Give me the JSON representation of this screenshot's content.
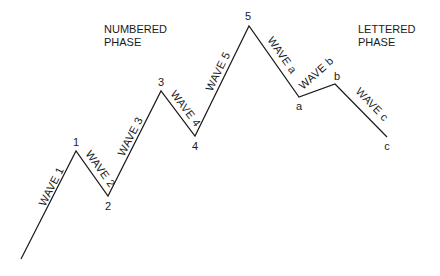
{
  "diagram": {
    "title_left": [
      "NUMBERED",
      "PHASE"
    ],
    "title_right": [
      "LETTERED",
      "PHASE"
    ],
    "colors": {
      "line": "#1a1a1a",
      "text": "#1a1a1a",
      "background": "#ffffff"
    },
    "vertices": [
      {
        "id": "start",
        "x": 21,
        "y": 259,
        "label": ""
      },
      {
        "id": "1",
        "x": 76,
        "y": 151,
        "label": "1"
      },
      {
        "id": "2",
        "x": 108,
        "y": 196,
        "label": "2"
      },
      {
        "id": "3",
        "x": 161,
        "y": 91,
        "label": "3"
      },
      {
        "id": "4",
        "x": 195,
        "y": 136,
        "label": "4"
      },
      {
        "id": "5",
        "x": 249,
        "y": 26,
        "label": "5"
      },
      {
        "id": "a",
        "x": 299,
        "y": 97,
        "label": "a"
      },
      {
        "id": "b",
        "x": 335,
        "y": 84,
        "label": "b"
      },
      {
        "id": "c",
        "x": 387,
        "y": 137,
        "label": "c"
      }
    ],
    "waves": [
      {
        "label": "WAVE 1",
        "from": "start",
        "to": "1"
      },
      {
        "label": "WAVE 2",
        "from": "1",
        "to": "2"
      },
      {
        "label": "WAVE 3",
        "from": "2",
        "to": "3"
      },
      {
        "label": "WAVE 4",
        "from": "3",
        "to": "4"
      },
      {
        "label": "WAVE 5",
        "from": "4",
        "to": "5"
      },
      {
        "label": "WAVE a",
        "from": "5",
        "to": "a"
      },
      {
        "label": "WAVE b",
        "from": "a",
        "to": "b"
      },
      {
        "label": "WAVE c",
        "from": "b",
        "to": "c"
      }
    ]
  }
}
